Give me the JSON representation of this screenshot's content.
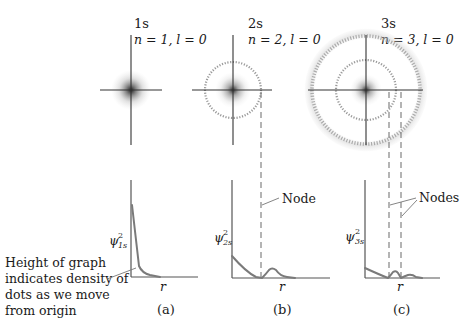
{
  "figure": {
    "type": "orbital-probability-density-diagram",
    "panels": [
      {
        "id": "a",
        "orbital": "1s",
        "quantum_numbers": "n = 1, l = 0",
        "n": 1,
        "l": 0,
        "y_label_symbol": "ψ",
        "y_label_subscript": "1s",
        "y_label_superscript": "2",
        "x_label": "r",
        "panel_label": "(a)",
        "nodes": 0
      },
      {
        "id": "b",
        "orbital": "2s",
        "quantum_numbers": "n = 2, l = 0",
        "n": 2,
        "l": 0,
        "y_label_symbol": "ψ",
        "y_label_subscript": "2s",
        "y_label_superscript": "2",
        "x_label": "r",
        "panel_label": "(b)",
        "nodes": 1,
        "callout": "Node"
      },
      {
        "id": "c",
        "orbital": "3s",
        "quantum_numbers": "n = 3, l = 0",
        "n": 3,
        "l": 0,
        "y_label_symbol": "ψ",
        "y_label_subscript": "3s",
        "y_label_superscript": "2",
        "x_label": "r",
        "panel_label": "(c)",
        "nodes": 2,
        "callout": "Nodes"
      }
    ],
    "annotation": {
      "lines": [
        "Height of graph",
        "indicates density of",
        "dots as we move",
        "from origin"
      ]
    }
  },
  "colors": {
    "ink": "#1a1a1a",
    "axis": "#555555",
    "curve": "#7a7a7a",
    "dots": "#3a3a3a"
  }
}
